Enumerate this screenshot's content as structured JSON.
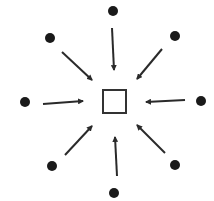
{
  "diagram": {
    "type": "radial-convergence",
    "colors": {
      "background": "#ffffff",
      "node": "#1a1a1a",
      "arrow": "#2a2a2a",
      "center_stroke": "#333333"
    },
    "center": {
      "shape": "square",
      "x": 103,
      "y": 90,
      "size": 23
    },
    "nodes": [
      {
        "id": "top",
        "cx": 113,
        "cy": 11
      },
      {
        "id": "top-right",
        "cx": 175,
        "cy": 36
      },
      {
        "id": "right",
        "cx": 201,
        "cy": 101
      },
      {
        "id": "bottom-right",
        "cx": 175,
        "cy": 165
      },
      {
        "id": "bottom",
        "cx": 114,
        "cy": 193
      },
      {
        "id": "bottom-left",
        "cx": 52,
        "cy": 166
      },
      {
        "id": "left",
        "cx": 25,
        "cy": 102
      },
      {
        "id": "top-left",
        "cx": 50,
        "cy": 38
      }
    ],
    "arrows": [
      {
        "from": "top",
        "x1": 112,
        "y1": 28,
        "x2": 114,
        "y2": 70
      },
      {
        "from": "top-right",
        "x1": 162,
        "y1": 49,
        "x2": 137,
        "y2": 79
      },
      {
        "from": "right",
        "x1": 185,
        "y1": 100,
        "x2": 146,
        "y2": 102
      },
      {
        "from": "bottom-right",
        "x1": 165,
        "y1": 153,
        "x2": 137,
        "y2": 125
      },
      {
        "from": "bottom",
        "x1": 117,
        "y1": 176,
        "x2": 115,
        "y2": 137
      },
      {
        "from": "bottom-left",
        "x1": 65,
        "y1": 155,
        "x2": 92,
        "y2": 126
      },
      {
        "from": "left",
        "x1": 43,
        "y1": 104,
        "x2": 83,
        "y2": 101
      },
      {
        "from": "top-left",
        "x1": 62,
        "y1": 52,
        "x2": 92,
        "y2": 80
      }
    ]
  }
}
